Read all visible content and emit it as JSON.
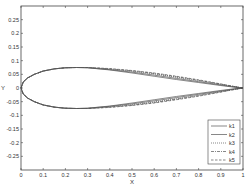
{
  "chart_data": {
    "type": "line",
    "title": "",
    "xlabel": "X",
    "ylabel": "Y",
    "xlim": [
      0,
      1
    ],
    "ylim": [
      -0.3,
      0.3
    ],
    "grid": false,
    "legend_position": "lower right",
    "x_ticks": [
      "0",
      "0.1",
      "0.2",
      "0.3",
      "0.4",
      "0.5",
      "0.6",
      "0.7",
      "0.8",
      "0.9",
      "1"
    ],
    "y_ticks": [
      "0.25",
      "0.2",
      "0.15",
      "0.1",
      "0.05",
      "0",
      "-0.05",
      "-0.1",
      "-0.15",
      "-0.2",
      "-0.25"
    ],
    "x": [
      0,
      0.01,
      0.03,
      0.06,
      0.1,
      0.15,
      0.2,
      0.25,
      0.3,
      0.4,
      0.5,
      0.6,
      0.7,
      0.8,
      0.9,
      0.95,
      1.0
    ],
    "series": [
      {
        "name": "k1",
        "style": "solid",
        "upper": [
          0,
          0.022,
          0.037,
          0.05,
          0.062,
          0.07,
          0.074,
          0.075,
          0.074,
          0.066,
          0.055,
          0.043,
          0.031,
          0.02,
          0.009,
          0.004,
          0
        ],
        "lower": [
          0,
          -0.022,
          -0.037,
          -0.05,
          -0.062,
          -0.07,
          -0.074,
          -0.075,
          -0.074,
          -0.066,
          -0.055,
          -0.043,
          -0.031,
          -0.02,
          -0.009,
          -0.004,
          0
        ]
      },
      {
        "name": "k2",
        "style": "solid",
        "upper": [
          0,
          0.022,
          0.037,
          0.05,
          0.062,
          0.07,
          0.074,
          0.075,
          0.074,
          0.067,
          0.058,
          0.047,
          0.035,
          0.023,
          0.011,
          0.005,
          0
        ],
        "lower": [
          0,
          -0.022,
          -0.037,
          -0.05,
          -0.062,
          -0.07,
          -0.074,
          -0.075,
          -0.074,
          -0.067,
          -0.058,
          -0.047,
          -0.035,
          -0.023,
          -0.011,
          -0.005,
          0
        ]
      },
      {
        "name": "k3",
        "style": "dotted",
        "upper": [
          0,
          0.022,
          0.037,
          0.05,
          0.062,
          0.07,
          0.074,
          0.075,
          0.075,
          0.069,
          0.061,
          0.051,
          0.039,
          0.026,
          0.013,
          0.006,
          0
        ],
        "lower": [
          0,
          -0.022,
          -0.037,
          -0.05,
          -0.062,
          -0.07,
          -0.074,
          -0.075,
          -0.075,
          -0.069,
          -0.061,
          -0.051,
          -0.039,
          -0.026,
          -0.013,
          -0.006,
          0
        ]
      },
      {
        "name": "k4",
        "style": "dashdot",
        "upper": [
          0,
          0.022,
          0.037,
          0.05,
          0.062,
          0.07,
          0.074,
          0.075,
          0.075,
          0.07,
          0.063,
          0.053,
          0.041,
          0.028,
          0.014,
          0.007,
          0
        ],
        "lower": [
          0,
          -0.022,
          -0.037,
          -0.05,
          -0.062,
          -0.07,
          -0.074,
          -0.075,
          -0.075,
          -0.07,
          -0.063,
          -0.053,
          -0.041,
          -0.028,
          -0.014,
          -0.007,
          0
        ]
      },
      {
        "name": "k5",
        "style": "dashed",
        "upper": [
          0,
          0.022,
          0.037,
          0.05,
          0.062,
          0.07,
          0.074,
          0.075,
          0.075,
          0.071,
          0.064,
          0.055,
          0.043,
          0.03,
          0.015,
          0.007,
          0
        ],
        "lower": [
          0,
          -0.022,
          -0.037,
          -0.05,
          -0.062,
          -0.07,
          -0.074,
          -0.075,
          -0.075,
          -0.071,
          -0.064,
          -0.055,
          -0.043,
          -0.03,
          -0.015,
          -0.007,
          0
        ]
      }
    ],
    "colors": {
      "line": "#555555",
      "axis": "#444444",
      "background": "#ffffff"
    }
  }
}
